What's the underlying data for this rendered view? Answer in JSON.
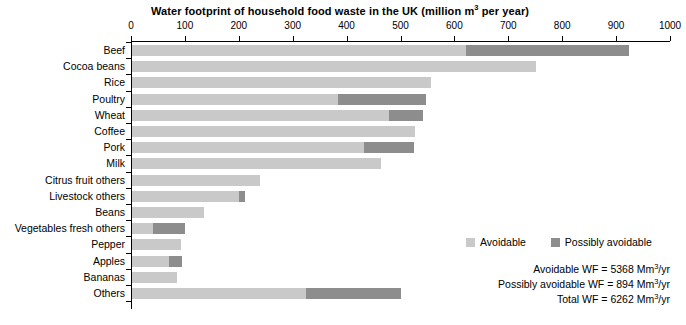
{
  "chart_data": {
    "type": "bar",
    "orientation": "horizontal",
    "stacked": true,
    "title_prefix": "Water footprint of household food waste in the UK (million m",
    "title_sup": "3",
    "title_suffix": " per year)",
    "title": "Water footprint of household food waste in the UK (million m3 per year)",
    "xlabel": "",
    "ylabel": "",
    "xlim": [
      0,
      1000
    ],
    "xticks": [
      0,
      100,
      200,
      300,
      400,
      500,
      600,
      700,
      800,
      900,
      1000
    ],
    "xtick_labels": [
      "0",
      "100",
      "200",
      "300",
      "400",
      "500",
      "600",
      "700",
      "800",
      "900",
      "1000"
    ],
    "grid": false,
    "legend_position": "right-middle",
    "categories": [
      "Beef",
      "Cocoa beans",
      "Rice",
      "Poultry",
      "Wheat",
      "Coffee",
      "Pork",
      "Milk",
      "Citrus fruit others",
      "Livestock others",
      "Beans",
      "Vegetables fresh others",
      "Pepper",
      "Apples",
      "Bananas",
      "Others"
    ],
    "series": [
      {
        "name": "Avoidable",
        "color": "#c9c9c9",
        "values": [
          620,
          750,
          555,
          382,
          477,
          525,
          430,
          462,
          238,
          199,
          134,
          39,
          91,
          69,
          84,
          323
        ]
      },
      {
        "name": "Possibly avoidable",
        "color": "#8d8d8d",
        "values": [
          302,
          0,
          0,
          163,
          63,
          0,
          93,
          0,
          0,
          11,
          0,
          60,
          0,
          24,
          0,
          176
        ]
      }
    ],
    "totals": [
      922,
      750,
      555,
      545,
      540,
      525,
      523,
      462,
      238,
      210,
      134,
      99,
      91,
      93,
      84,
      499
    ]
  },
  "legend": {
    "items": [
      {
        "label": "Avoidable",
        "color": "#c9c9c9"
      },
      {
        "label": "Possibly avoidable",
        "color": "#8d8d8d"
      }
    ]
  },
  "summary": {
    "lines": [
      {
        "prefix": "Avoidable WF = 5368 Mm",
        "sup": "3",
        "suffix": "/yr"
      },
      {
        "prefix": "Possibly avoidable WF = 894 Mm",
        "sup": "3",
        "suffix": "/yr"
      },
      {
        "prefix": "Total WF = 6262 Mm",
        "sup": "3",
        "suffix": "/yr"
      }
    ]
  }
}
